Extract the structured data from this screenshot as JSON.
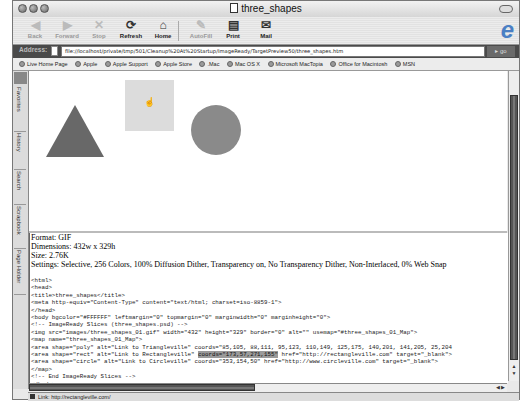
{
  "window": {
    "title": "three_shapes"
  },
  "toolbar": {
    "buttons": [
      {
        "label": "Back",
        "icon": "◀",
        "enabled": false
      },
      {
        "label": "Forward",
        "icon": "▶",
        "enabled": false
      },
      {
        "label": "Stop",
        "icon": "✕",
        "enabled": false
      },
      {
        "label": "Refresh",
        "icon": "⟳",
        "enabled": true
      },
      {
        "label": "Home",
        "icon": "⌂",
        "enabled": true
      },
      {
        "label": "AutoFill",
        "icon": "✎",
        "enabled": false
      },
      {
        "label": "Print",
        "icon": "▤",
        "enabled": true
      },
      {
        "label": "Mail",
        "icon": "✉",
        "enabled": true
      }
    ]
  },
  "address": {
    "label": "Address:",
    "value": "file://localhost/private/tmp/501/Cleanup%20At%20Startup/ImageReady/TargetPreview50/three_shapes.htm",
    "go_label": "go"
  },
  "links": [
    "Live Home Page",
    "Apple",
    "Apple Support",
    "Apple Store",
    ".Mac",
    "Mac OS X",
    "Microsoft MacTopia",
    "Office for Macintosh",
    "MSN"
  ],
  "sidebar": {
    "tabs": [
      "Favorites",
      "History",
      "Search",
      "Scrapbook",
      "Page Holder"
    ]
  },
  "image": {
    "shapes": [
      "triangle",
      "rectangle",
      "circle"
    ],
    "colors": {
      "triangle": "#686868",
      "rectangle": "#dcdcdc",
      "circle": "#8a8a8a"
    }
  },
  "info": {
    "format": "Format: GIF",
    "dimensions": "Dimensions: 432w x 329h",
    "size": "Size: 2.76K",
    "settings": "Settings: Selective, 256 Colors, 100% Diffusion Dither, Transparency on, No Transparency Dither, Non-Interlaced, 0% Web Snap"
  },
  "code": {
    "lines": [
      "<html>",
      "<head>",
      "<title>three_shapes</title>",
      "<meta http-equiv=\"Content-Type\" content=\"text/html; charset=iso-8859-1\">",
      "</head>",
      "<body bgcolor=\"#FFFFFF\" leftmargin=\"0\" topmargin=\"0\" marginwidth=\"0\" marginheight=\"0\">",
      "<!-- ImageReady Slices (three_shapes.psd) -->",
      "<img src=\"images/three_shapes_01.gif\" width=\"432\" height=\"329\" border=\"0\" alt=\"\" usemap=\"#three_shapes_01_Map\">",
      "<map name=\"three_shapes_01_Map\">",
      "<area shape=\"poly\" alt=\"Link to Triangleville\" coords=\"85,105, 88,111, 95,123, 110,149, 125,175, 140,201, 141,205, 25,204",
      "<area shape=\"rect\" alt=\"Link to Rectangleville\" ",
      "<area shape=\"circle\" alt=\"Link to Circleville\" coords=\"353,154,50\" href=\"http://www.circleville.com\" target=\"_blank\">",
      "</map>",
      "<!-- End ImageReady Slices -->",
      "</body>"
    ],
    "rect_highlight": "coords=\"173,57,271,155\"",
    "rect_tail": " href=\"http://rectangleville.com\" target=\"_blank\">"
  },
  "status": {
    "text": "Link: http://rectangleville.com/"
  }
}
